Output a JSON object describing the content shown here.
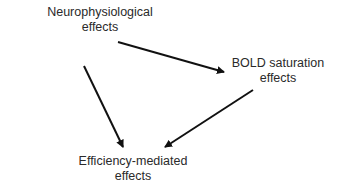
{
  "diagram": {
    "nodes": [
      {
        "id": "neurophysiological",
        "lines": [
          "Neurophysiological",
          "effects"
        ]
      },
      {
        "id": "bold-saturation",
        "lines": [
          "BOLD saturation",
          "effects"
        ]
      },
      {
        "id": "efficiency-mediated",
        "lines": [
          "Efficiency-mediated",
          "effects"
        ]
      }
    ],
    "edges": [
      {
        "from": "neurophysiological",
        "to": "bold-saturation"
      },
      {
        "from": "neurophysiological",
        "to": "efficiency-mediated"
      },
      {
        "from": "bold-saturation",
        "to": "efficiency-mediated"
      }
    ],
    "colors": {
      "text": "#2a2a2a",
      "arrow": "#111111",
      "background": "#ffffff"
    }
  }
}
